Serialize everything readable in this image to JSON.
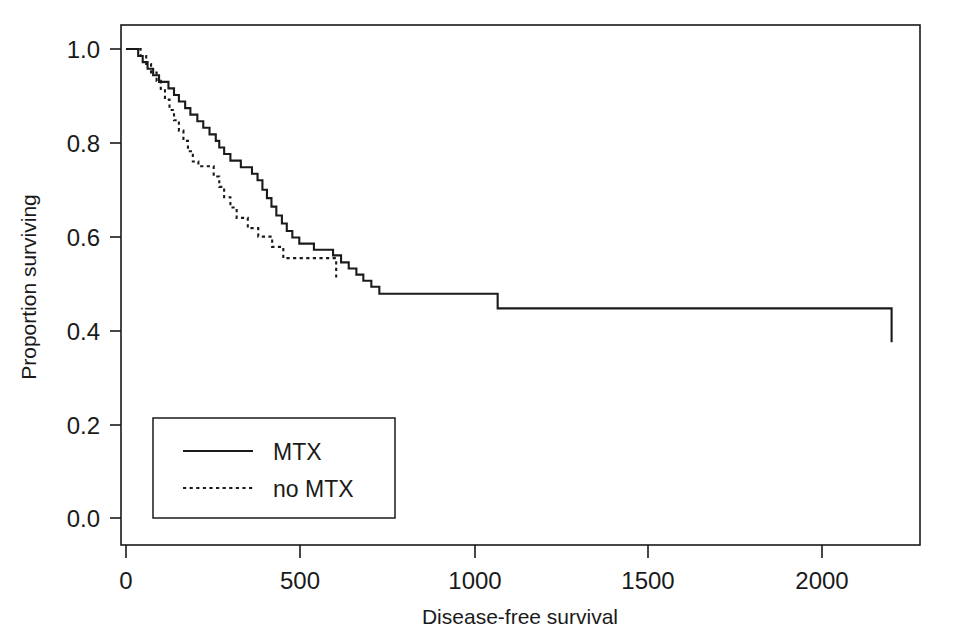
{
  "chart_data": {
    "type": "line",
    "subtype": "kaplan-meier-survival-step",
    "title": "",
    "xlabel": "Disease-free survival",
    "ylabel": "Proportion surviving",
    "xlim": [
      0,
      2300
    ],
    "ylim": [
      0.0,
      1.05
    ],
    "xticks": [
      0,
      500,
      1000,
      1500,
      2000
    ],
    "xtick_labels": [
      "0",
      "500",
      "1000",
      "1500",
      "2000"
    ],
    "yticks": [
      0.0,
      0.2,
      0.4,
      0.6,
      0.8,
      1.0
    ],
    "ytick_labels": [
      "0.0",
      "0.2",
      "0.4",
      "0.6",
      "0.8",
      "1.0"
    ],
    "grid": false,
    "frame": "box",
    "legend_position": "lower-left-inside",
    "line_color": "#1a1a1a",
    "background_color": "#ffffff",
    "series": [
      {
        "name": "MTX",
        "style": "solid",
        "points": [
          [
            0,
            1.0
          ],
          [
            35,
            1.0
          ],
          [
            35,
            0.985
          ],
          [
            48,
            0.985
          ],
          [
            48,
            0.972
          ],
          [
            62,
            0.972
          ],
          [
            62,
            0.958
          ],
          [
            78,
            0.958
          ],
          [
            78,
            0.944
          ],
          [
            95,
            0.944
          ],
          [
            95,
            0.93
          ],
          [
            110,
            0.93
          ],
          [
            110,
            0.93
          ],
          [
            122,
            0.93
          ],
          [
            122,
            0.916
          ],
          [
            138,
            0.916
          ],
          [
            138,
            0.902
          ],
          [
            152,
            0.902
          ],
          [
            152,
            0.888
          ],
          [
            170,
            0.888
          ],
          [
            170,
            0.874
          ],
          [
            185,
            0.874
          ],
          [
            185,
            0.86
          ],
          [
            205,
            0.86
          ],
          [
            205,
            0.846
          ],
          [
            222,
            0.846
          ],
          [
            222,
            0.832
          ],
          [
            240,
            0.832
          ],
          [
            240,
            0.818
          ],
          [
            258,
            0.818
          ],
          [
            258,
            0.804
          ],
          [
            268,
            0.804
          ],
          [
            268,
            0.79
          ],
          [
            282,
            0.79
          ],
          [
            282,
            0.776
          ],
          [
            300,
            0.776
          ],
          [
            300,
            0.762
          ],
          [
            330,
            0.762
          ],
          [
            330,
            0.748
          ],
          [
            362,
            0.748
          ],
          [
            362,
            0.734
          ],
          [
            378,
            0.734
          ],
          [
            378,
            0.72
          ],
          [
            392,
            0.72
          ],
          [
            392,
            0.7
          ],
          [
            405,
            0.7
          ],
          [
            405,
            0.682
          ],
          [
            418,
            0.682
          ],
          [
            418,
            0.664
          ],
          [
            432,
            0.664
          ],
          [
            432,
            0.645
          ],
          [
            448,
            0.645
          ],
          [
            448,
            0.628
          ],
          [
            462,
            0.628
          ],
          [
            462,
            0.612
          ],
          [
            478,
            0.612
          ],
          [
            478,
            0.598
          ],
          [
            498,
            0.598
          ],
          [
            498,
            0.585
          ],
          [
            540,
            0.585
          ],
          [
            540,
            0.572
          ],
          [
            595,
            0.572
          ],
          [
            595,
            0.56
          ],
          [
            618,
            0.56
          ],
          [
            618,
            0.545
          ],
          [
            640,
            0.545
          ],
          [
            640,
            0.532
          ],
          [
            662,
            0.532
          ],
          [
            662,
            0.519
          ],
          [
            682,
            0.519
          ],
          [
            682,
            0.506
          ],
          [
            705,
            0.506
          ],
          [
            705,
            0.493
          ],
          [
            728,
            0.493
          ],
          [
            728,
            0.478
          ],
          [
            760,
            0.478
          ],
          [
            1068,
            0.478
          ],
          [
            1068,
            0.447
          ],
          [
            2200,
            0.447
          ],
          [
            2200,
            0.375
          ]
        ]
      },
      {
        "name": "no MTX",
        "style": "dotted",
        "points": [
          [
            0,
            1.0
          ],
          [
            42,
            1.0
          ],
          [
            42,
            0.985
          ],
          [
            58,
            0.985
          ],
          [
            58,
            0.968
          ],
          [
            72,
            0.968
          ],
          [
            72,
            0.95
          ],
          [
            88,
            0.95
          ],
          [
            88,
            0.932
          ],
          [
            100,
            0.932
          ],
          [
            100,
            0.912
          ],
          [
            112,
            0.912
          ],
          [
            112,
            0.892
          ],
          [
            125,
            0.892
          ],
          [
            125,
            0.87
          ],
          [
            138,
            0.87
          ],
          [
            138,
            0.848
          ],
          [
            152,
            0.848
          ],
          [
            152,
            0.826
          ],
          [
            165,
            0.826
          ],
          [
            165,
            0.804
          ],
          [
            178,
            0.804
          ],
          [
            178,
            0.782
          ],
          [
            192,
            0.782
          ],
          [
            192,
            0.76
          ],
          [
            208,
            0.76
          ],
          [
            208,
            0.75
          ],
          [
            252,
            0.75
          ],
          [
            252,
            0.728
          ],
          [
            268,
            0.728
          ],
          [
            268,
            0.706
          ],
          [
            282,
            0.706
          ],
          [
            282,
            0.684
          ],
          [
            300,
            0.684
          ],
          [
            300,
            0.662
          ],
          [
            318,
            0.662
          ],
          [
            318,
            0.64
          ],
          [
            350,
            0.64
          ],
          [
            350,
            0.618
          ],
          [
            380,
            0.618
          ],
          [
            380,
            0.6
          ],
          [
            420,
            0.6
          ],
          [
            420,
            0.578
          ],
          [
            452,
            0.578
          ],
          [
            452,
            0.554
          ],
          [
            604,
            0.554
          ],
          [
            604,
            0.512
          ]
        ]
      }
    ],
    "annotations": [
      {
        "text": "censor-tick-no-mtx",
        "x": 604,
        "y": 0.554
      }
    ]
  },
  "legend": {
    "entries": [
      {
        "label": "MTX",
        "style": "solid"
      },
      {
        "label": "no MTX",
        "style": "dotted"
      }
    ]
  }
}
